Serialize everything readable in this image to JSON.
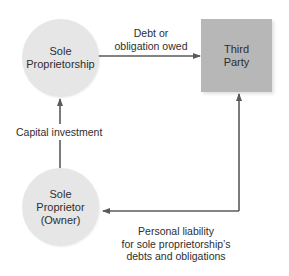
{
  "diagram": {
    "nodes": {
      "sole_proprietorship": {
        "line1": "Sole",
        "line2": "Proprietorship"
      },
      "third_party": {
        "line1": "Third",
        "line2": "Party"
      },
      "sole_proprietor": {
        "line1": "Sole",
        "line2": "Proprietor",
        "line3": "(Owner)"
      }
    },
    "edges": {
      "debt": {
        "line1": "Debt or",
        "line2": "obligation owed"
      },
      "capital": {
        "text": "Capital investment"
      },
      "liability": {
        "line1": "Personal liability",
        "line2": "for sole proprietorship’s",
        "line3": "debts and obligations"
      }
    },
    "colors": {
      "circle_fill": "#e6e6e6",
      "box_fill": "#b7b7b7",
      "arrow": "#5a5a5a"
    }
  }
}
